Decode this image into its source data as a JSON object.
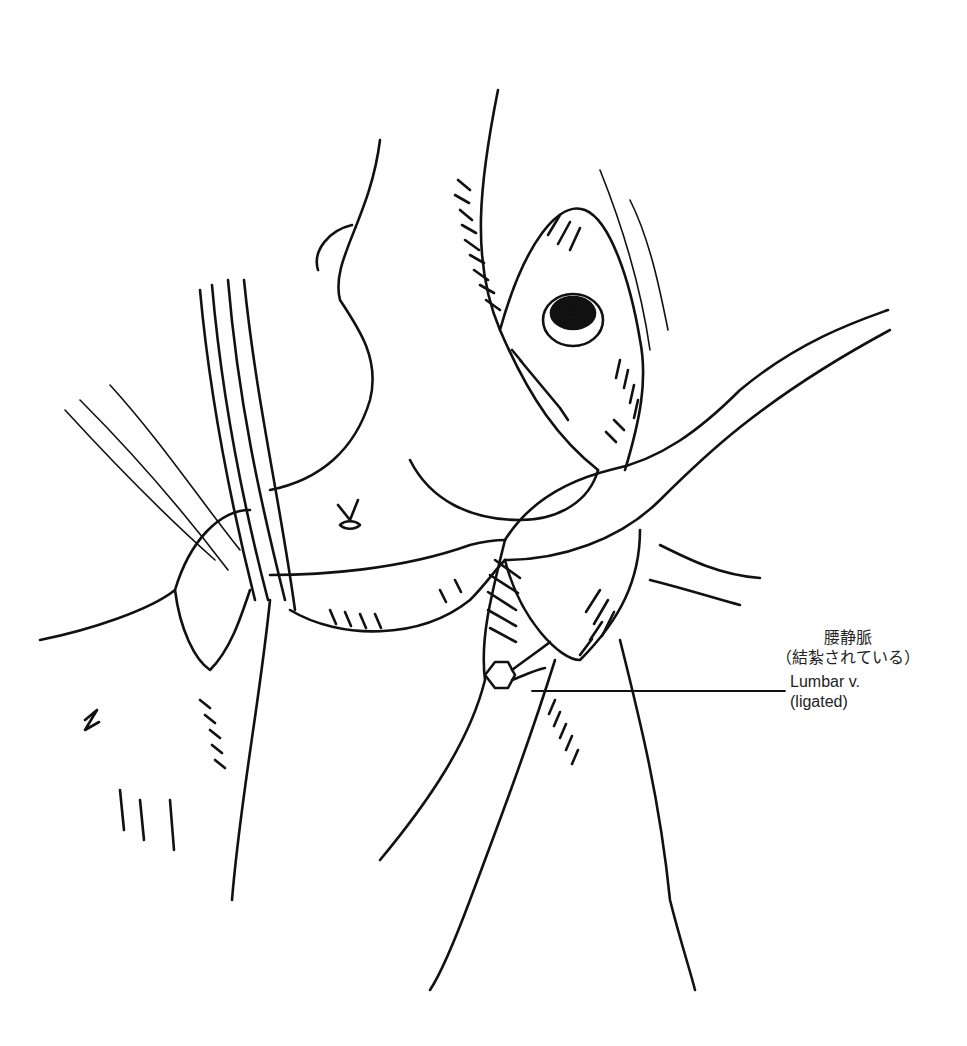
{
  "figure": {
    "type": "surgical line illustration",
    "labels": [
      {
        "id": "lumbar-vein",
        "japanese_line1": "腰静脈",
        "japanese_line2": "（結紮されている）",
        "english_line1": "Lumbar v.",
        "english_line2": "(ligated)"
      }
    ],
    "colors": {
      "ink": "#111111",
      "background": "#ffffff",
      "label_text": "#222222"
    }
  }
}
